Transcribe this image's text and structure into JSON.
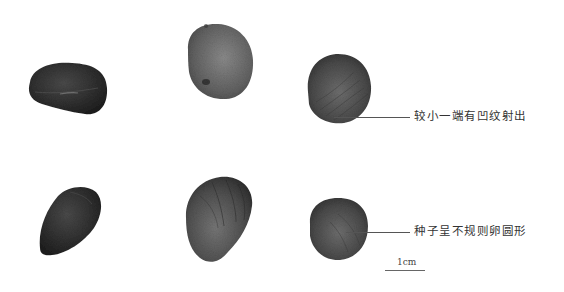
{
  "figure": {
    "type": "specimen-photograph",
    "specimen_count": 6,
    "layout": "2 rows x 3 columns"
  },
  "annotations": [
    {
      "id": "small-end-ridges",
      "text": "较小一端有凹纹射出"
    },
    {
      "id": "seed-shape",
      "text": "种子呈不规则卵圆形"
    }
  ],
  "scale_bar": {
    "label": "1cm"
  },
  "colors": {
    "background": "#ffffff",
    "seed_dark": "#2e2e2e",
    "seed_mid": "#5a5a5a",
    "seed_light": "#7a7a7a",
    "leader_line": "#555555",
    "text": "#333333"
  }
}
